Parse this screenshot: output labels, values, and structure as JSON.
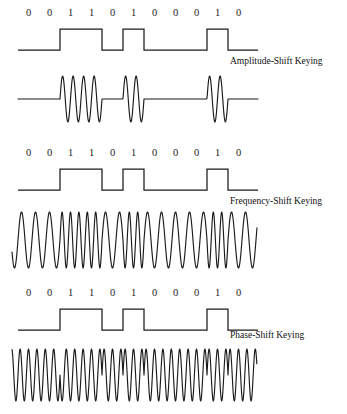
{
  "figure": {
    "background": "#ffffff",
    "line_color": "#1b1b1b",
    "bits": [
      "0",
      "0",
      "1",
      "1",
      "0",
      "1",
      "0",
      "0",
      "0",
      "1",
      "0"
    ],
    "bit_string": "0 0 1 1 0 1 0 0 0 1 0"
  },
  "sections": [
    {
      "id": "ask",
      "caption": "Amplitude-Shift Keying",
      "digital_label": "binary data waveform",
      "modulated_label": "amplitude-shift keyed carrier"
    },
    {
      "id": "fsk",
      "caption": "Frequency-Shift Keying",
      "digital_label": "binary data waveform",
      "modulated_label": "frequency-shift keyed carrier"
    },
    {
      "id": "psk",
      "caption": "Phase-Shift Keying",
      "digital_label": "binary data waveform",
      "modulated_label": "phase-shift keyed carrier"
    }
  ],
  "chart_data": {
    "type": "line",
    "title": "",
    "xlabel": "",
    "ylabel": "",
    "grid": false,
    "legend": "none",
    "bit_sequence": [
      0,
      0,
      1,
      1,
      0,
      1,
      0,
      0,
      0,
      1,
      0
    ],
    "bit_count": 11,
    "waveforms": [
      {
        "name": "ASK digital data",
        "kind": "nrz",
        "levels": [
          0,
          0,
          1,
          1,
          0,
          1,
          0,
          0,
          0,
          1,
          0
        ]
      },
      {
        "name": "ASK modulated carrier",
        "kind": "ask",
        "carrier_cycles_per_bit": 2,
        "amplitude_for_one": 1.0,
        "amplitude_for_zero": 0.0,
        "burst_bits": [
          2,
          3,
          5,
          9
        ]
      },
      {
        "name": "FSK digital data",
        "kind": "nrz",
        "levels": [
          0,
          0,
          1,
          1,
          0,
          1,
          0,
          0,
          0,
          1,
          0
        ]
      },
      {
        "name": "FSK modulated carrier",
        "kind": "fsk",
        "cycles_per_bit_for_zero": 1.5,
        "cycles_per_bit_for_one": 2.5,
        "amplitude": 1.0
      },
      {
        "name": "PSK digital data",
        "kind": "nrz",
        "levels": [
          0,
          0,
          1,
          1,
          0,
          1,
          0,
          0,
          0,
          1,
          0
        ]
      },
      {
        "name": "PSK modulated carrier",
        "kind": "psk",
        "cycles_per_bit": 2.5,
        "phase_for_zero_deg": 0,
        "phase_for_one_deg": 180,
        "amplitude": 1.0
      }
    ]
  }
}
